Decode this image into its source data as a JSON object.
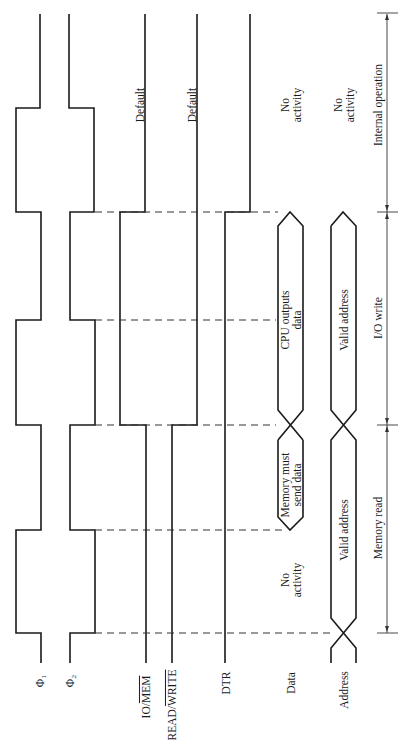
{
  "diagram": {
    "type": "timing-diagram",
    "orientation": "rotated-90",
    "signals": [
      {
        "id": "phi1",
        "label": "Φ₁"
      },
      {
        "id": "phi2",
        "label": "Φ₂"
      },
      {
        "id": "io_mem",
        "label": "IO/MEM",
        "overline": "MEM"
      },
      {
        "id": "read_write",
        "label": "READ/WRITE",
        "overline": "WRITE"
      },
      {
        "id": "dtr",
        "label": "DTR"
      },
      {
        "id": "data",
        "label": "Data"
      },
      {
        "id": "address",
        "label": "Address"
      }
    ],
    "annotations": {
      "io_mem_default": "Default",
      "read_write_default": "Default",
      "data_no_activity_top_1": "No",
      "data_no_activity_top_2": "activity",
      "address_no_activity_1": "No",
      "address_no_activity_2": "activity",
      "cpu_outputs_1": "CPU outputs",
      "cpu_outputs_2": "data",
      "memory_must_1": "Memory must",
      "memory_must_2": "send data",
      "data_no_activity_bottom_1": "No",
      "data_no_activity_bottom_2": "activity",
      "valid_address_1": "Valid address",
      "valid_address_2": "Valid address"
    },
    "phases": [
      {
        "label": "Internal operation"
      },
      {
        "label": "I/O write"
      },
      {
        "label": "Memory read"
      }
    ]
  }
}
